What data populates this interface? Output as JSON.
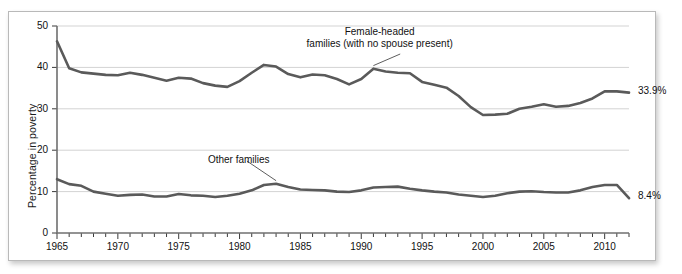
{
  "figure": {
    "top_caption_text": "",
    "frame_border_color": "#b9b9b9",
    "background_color": "#ffffff"
  },
  "chart_data": {
    "type": "line",
    "title": "",
    "xlabel": "",
    "ylabel": "Percentage in poverty",
    "xlim": [
      1965,
      2012
    ],
    "ylim": [
      0,
      50
    ],
    "ytick_values": [
      0,
      10,
      20,
      30,
      40,
      50
    ],
    "ytick_labels": [
      "0",
      "10",
      "20",
      "30",
      "40",
      "50"
    ],
    "xtick_values": [
      1965,
      1970,
      1975,
      1980,
      1985,
      1990,
      1995,
      2000,
      2005,
      2010
    ],
    "xtick_labels": [
      "1965",
      "1970",
      "1975",
      "1980",
      "1985",
      "1990",
      "1995",
      "2000",
      "2005",
      "2010"
    ],
    "xminor_step": 1,
    "grid": "horizontal",
    "legend": "annotations",
    "line_color": "#5a5a5a",
    "line_width": 2.6,
    "x": [
      1965,
      1966,
      1967,
      1968,
      1969,
      1970,
      1971,
      1972,
      1973,
      1974,
      1975,
      1976,
      1977,
      1978,
      1979,
      1980,
      1981,
      1982,
      1983,
      1984,
      1985,
      1986,
      1987,
      1988,
      1989,
      1990,
      1991,
      1992,
      1993,
      1994,
      1995,
      1996,
      1997,
      1998,
      1999,
      2000,
      2001,
      2002,
      2003,
      2004,
      2005,
      2006,
      2007,
      2008,
      2009,
      2010,
      2011,
      2012
    ],
    "series": [
      {
        "name": "Female-headed families (with no spouse present)",
        "annotation": "Female-headed\nfamilies (with no spouse present)",
        "end_label": "33.9%",
        "values": [
          46.3,
          39.8,
          38.8,
          38.5,
          38.2,
          38.1,
          38.7,
          38.2,
          37.5,
          36.8,
          37.5,
          37.3,
          36.2,
          35.6,
          35.3,
          36.7,
          38.7,
          40.6,
          40.2,
          38.4,
          37.6,
          38.3,
          38.1,
          37.2,
          35.9,
          37.2,
          39.7,
          39.0,
          38.7,
          38.6,
          36.5,
          35.8,
          35.1,
          33.1,
          30.4,
          28.5,
          28.6,
          28.8,
          30.0,
          30.5,
          31.1,
          30.5,
          30.7,
          31.4,
          32.5,
          34.2,
          34.2,
          33.9
        ]
      },
      {
        "name": "Other families",
        "annotation": "Other families",
        "end_label": "8.4%",
        "values": [
          13.0,
          11.8,
          11.4,
          10.0,
          9.5,
          9.0,
          9.2,
          9.3,
          8.8,
          8.8,
          9.4,
          9.1,
          9.0,
          8.7,
          9.0,
          9.5,
          10.3,
          11.6,
          11.9,
          11.1,
          10.5,
          10.4,
          10.3,
          10.0,
          9.9,
          10.3,
          11.0,
          11.1,
          11.2,
          10.7,
          10.3,
          10.0,
          9.8,
          9.3,
          9.0,
          8.7,
          9.0,
          9.6,
          10.0,
          10.1,
          9.9,
          9.8,
          9.8,
          10.3,
          11.1,
          11.6,
          11.6,
          8.4
        ]
      }
    ]
  }
}
